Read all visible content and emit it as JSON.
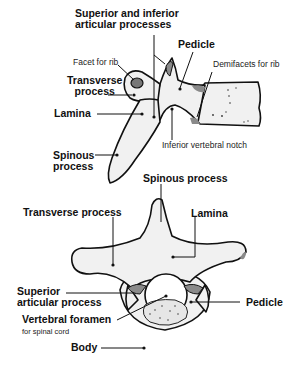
{
  "diagram": {
    "lateral_view": {
      "labels": {
        "articular": "Superior and inferior",
        "articular_line2": "articular processes",
        "pedicle": "Pedicle",
        "facet": "Facet for rib",
        "demifacets": "Demifacets for rib",
        "transverse": "Transverse",
        "transverse_line2": "process",
        "lamina": "Lamina",
        "notch": "Inferior vertebral notch",
        "spinous": "Spinous",
        "spinous_line2": "process"
      }
    },
    "superior_view": {
      "labels": {
        "spinous": "Spinous process",
        "transverse": "Transverse process",
        "lamina": "Lamina",
        "superior_articular": "Superior",
        "superior_articular_line2": "articular  process",
        "pedicle": "Pedicle",
        "foramen": "Vertebral foramen",
        "foramen_note": "for spinal cord",
        "body": "Body"
      }
    },
    "colors": {
      "bone_fill": "#f1f1f1",
      "outline": "#111111",
      "facet_shade": "#8a8a8a",
      "background": "#ffffff"
    }
  }
}
